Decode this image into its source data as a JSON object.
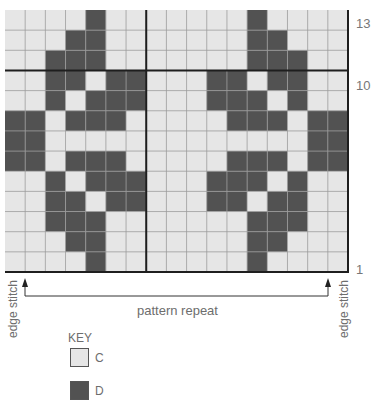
{
  "chart_data": {
    "type": "table",
    "columns": 17,
    "rows": 13,
    "row_labels": [
      {
        "row": 13,
        "label": "13"
      },
      {
        "row": 10,
        "label": "10"
      },
      {
        "row": 1,
        "label": "1"
      }
    ],
    "grid_top_to_bottom": [
      "CCCCDCCCCCCCDCCCC",
      "CCCDDCCCCCCCDDCCC",
      "CCDDDCCCCCCCDDDCC",
      "CCDDCDDCCCDDCDDCC",
      "CCDCDDDCCCDDDCDCC",
      "DDCDDDCCCCCDDDCDD",
      "DDCCCCCCCCCCCCCDD",
      "DDCDDDCCCCCDDDCDD",
      "CCDCDDDCCCDDDCDCC",
      "CCDDCDDCCCDDCDDCC",
      "CCDDDCCCCCCCDDDCC",
      "CCCDDCCCCCCCDDCCC",
      "CCCCDCCCCCCCDCCCC"
    ],
    "thick_lines": {
      "horizontal_after_row_from_top": 3,
      "vertical_after_col": 7
    },
    "annotations": {
      "left_edge": "edge stitch",
      "right_edge": "edge stitch",
      "repeat": "pattern repeat"
    },
    "legend": [
      {
        "symbol": "C",
        "color": "#e6e6e6"
      },
      {
        "symbol": "D",
        "color": "#525252"
      }
    ]
  },
  "labels": {
    "row_13": "13",
    "row_10": "10",
    "row_1": "1",
    "edge_left": "edge stitch",
    "edge_right": "edge stitch",
    "repeat": "pattern repeat",
    "key_title": "KEY",
    "key_c": "C",
    "key_d": "D"
  },
  "colors": {
    "light": "#e6e6e6",
    "dark": "#525252",
    "grid": "#9a9a9a",
    "thick": "#1e1e1e",
    "arrow": "#333333"
  }
}
